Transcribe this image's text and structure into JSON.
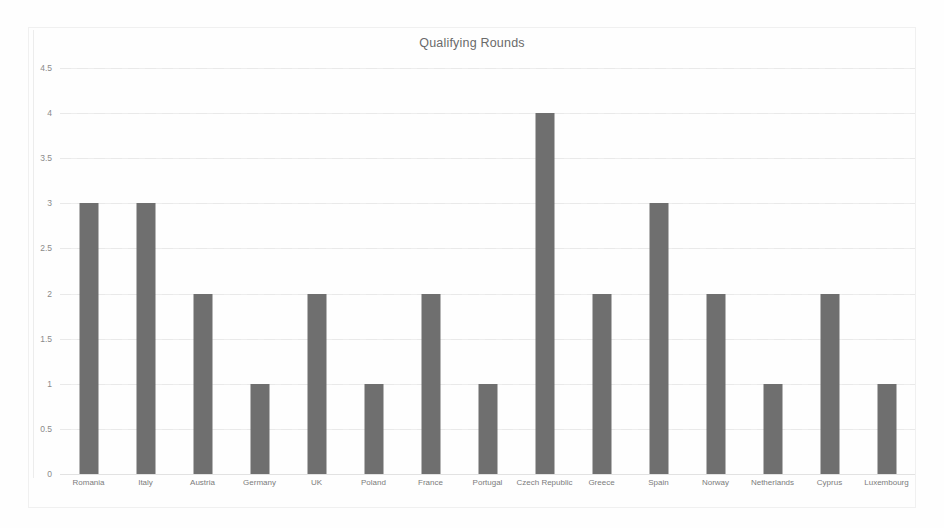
{
  "chart_data": {
    "type": "bar",
    "title": "Qualifying Rounds",
    "xlabel": "",
    "ylabel": "",
    "categories": [
      "Romania",
      "Italy",
      "Austria",
      "Germany",
      "UK",
      "Poland",
      "France",
      "Portugal",
      "Czech Republic",
      "Greece",
      "Spain",
      "Norway",
      "Netherlands",
      "Cyprus",
      "Luxembourg"
    ],
    "values": [
      3,
      3,
      2,
      1,
      2,
      1,
      2,
      1,
      4,
      2,
      3,
      2,
      1,
      2,
      1
    ],
    "ylim": [
      0,
      4.5
    ],
    "yticks": [
      "0",
      "0.5",
      "1",
      "1.5",
      "2",
      "2.5",
      "3",
      "3.5",
      "4",
      "4.5"
    ],
    "ytick_values": [
      0,
      0.5,
      1,
      1.5,
      2,
      2.5,
      3,
      3.5,
      4,
      4.5
    ],
    "grid": true,
    "legend": false,
    "bar_color": "#6f6f6f",
    "grid_color": "#ededed",
    "text_color": "#7c7c7c",
    "background": "#fefefe"
  }
}
